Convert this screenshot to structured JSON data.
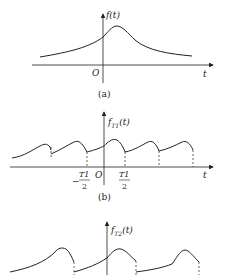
{
  "panels": [
    {
      "id": "a",
      "caption": "(a)",
      "y_label": "f(t)",
      "x_label": "t",
      "origin_label": "O",
      "description": "Single aperiodic pulse-like signal, peak slightly right of origin"
    },
    {
      "id": "b",
      "caption": "(b)",
      "y_label_base": "f",
      "y_label_sub": "T1",
      "y_label_arg": "(t)",
      "x_label": "t",
      "origin_label": "O",
      "tick_left_num": "T1",
      "tick_left_den": "2",
      "tick_left_sign": "−",
      "tick_right_num": "T1",
      "tick_right_den": "2",
      "description": "Periodic extension of f(t) with period T1"
    },
    {
      "id": "c",
      "caption": "",
      "y_label_base": "f",
      "y_label_sub": "T2",
      "y_label_arg": "(t)",
      "description": "Periodic extension of f(t) with longer period T2"
    }
  ],
  "colors": {
    "stroke": "#222222",
    "background": "#ffffff"
  }
}
